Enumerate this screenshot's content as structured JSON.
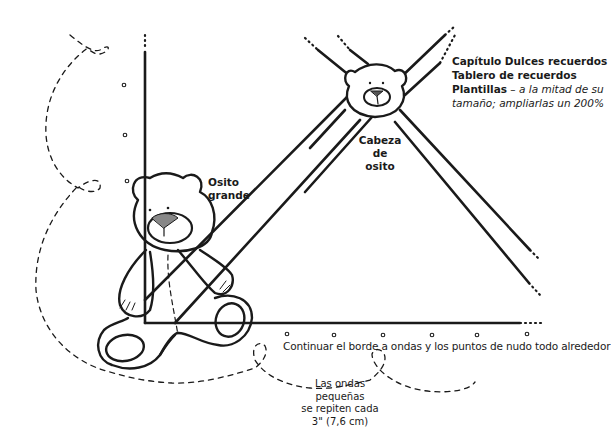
{
  "title_block": {
    "line1": "Capítulo Dulces recuerdos",
    "line2": "Tablero de recuerdos",
    "line3_bold": "Plantillas",
    "line3_italic": " – a la mitad de su",
    "line4_italic": "tamaño; ampliarlas un 200%"
  },
  "labels": {
    "bear_head": [
      "Cabeza",
      "de osito"
    ],
    "big_bear": [
      "Osito",
      "grande"
    ],
    "border_instruction": "Continuar el borde a ondas y los puntos de nudo todo alrededor",
    "wave_note": [
      "Las ondas pequeñas",
      "se repiten cada",
      "3\" (7,6 cm)"
    ]
  },
  "colors": {
    "ink": "#1a1a1a",
    "background": "#ffffff"
  },
  "figures": [
    {
      "name": "big-bear",
      "description": "Osito grande - sitting teddy bear outline"
    },
    {
      "name": "bear-head",
      "description": "Cabeza de osito - small bear head at line crossing"
    }
  ]
}
